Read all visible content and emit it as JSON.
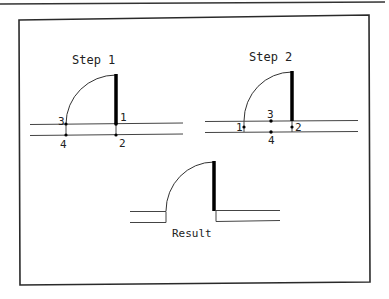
{
  "figure": {
    "colors": {
      "line": "#333333",
      "frame": "#2a2a2a",
      "door": "#000000",
      "text": "#222222"
    },
    "panels": [
      {
        "id": "step1",
        "title": "Step 1",
        "points": [
          {
            "label": "1",
            "x": 116,
            "y": 124
          },
          {
            "label": "2",
            "x": 116,
            "y": 135
          },
          {
            "label": "3",
            "x": 66,
            "y": 124
          },
          {
            "label": "4",
            "x": 66,
            "y": 135
          }
        ]
      },
      {
        "id": "step2",
        "title": "Step 2",
        "points": [
          {
            "label": "1",
            "x": 244,
            "y": 127
          },
          {
            "label": "2",
            "x": 292,
            "y": 127
          },
          {
            "label": "3",
            "x": 271,
            "y": 121
          },
          {
            "label": "4",
            "x": 271,
            "y": 132
          }
        ]
      },
      {
        "id": "result",
        "title": "Result"
      }
    ]
  }
}
